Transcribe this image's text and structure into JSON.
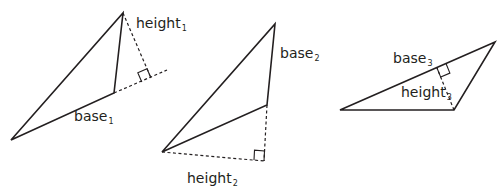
{
  "diagram": {
    "stroke_color": "#231f20",
    "triangles": [
      {
        "id": 1,
        "vertices": [
          [
            11,
            140
          ],
          [
            123,
            13
          ],
          [
            114,
            93
          ]
        ],
        "base_segment": [
          [
            11,
            140
          ],
          [
            114,
            93
          ]
        ],
        "base_extension": [
          [
            114,
            93
          ],
          [
            167,
            70
          ]
        ],
        "height_segment": [
          [
            123,
            13
          ],
          [
            151,
            78
          ]
        ],
        "right_angle_at": [
          151,
          78
        ],
        "base_label": {
          "text": "base",
          "sub": "1"
        },
        "height_label": {
          "text": "height",
          "sub": "1"
        }
      },
      {
        "id": 2,
        "vertices": [
          [
            162,
            152
          ],
          [
            275,
            24
          ],
          [
            267,
            105
          ]
        ],
        "base_segment": [
          [
            275,
            24
          ],
          [
            267,
            105
          ]
        ],
        "base_extension": [
          [
            267,
            105
          ],
          [
            264,
            161
          ]
        ],
        "height_segment": [
          [
            162,
            152
          ],
          [
            264,
            161
          ]
        ],
        "right_angle_at": [
          264,
          161
        ],
        "base_label": {
          "text": "base",
          "sub": "2"
        },
        "height_label": {
          "text": "height",
          "sub": "2"
        }
      },
      {
        "id": 3,
        "vertices": [
          [
            340,
            110
          ],
          [
            495,
            42
          ],
          [
            454,
            110
          ]
        ],
        "base_segment": [
          [
            340,
            110
          ],
          [
            495,
            42
          ]
        ],
        "height_segment": [
          [
            454,
            110
          ],
          [
            437,
            68
          ]
        ],
        "right_angle_at": [
          437,
          68
        ],
        "base_label": {
          "text": "base",
          "sub": "3"
        },
        "height_label": {
          "text": "height",
          "sub": "3"
        }
      }
    ]
  },
  "labels": {
    "base1": {
      "text": "base",
      "sub": "1"
    },
    "height1": {
      "text": "height",
      "sub": "1"
    },
    "base2": {
      "text": "base",
      "sub": "2"
    },
    "height2": {
      "text": "height",
      "sub": "2"
    },
    "base3": {
      "text": "base",
      "sub": "3"
    },
    "height3": {
      "text": "height",
      "sub": "3"
    }
  }
}
